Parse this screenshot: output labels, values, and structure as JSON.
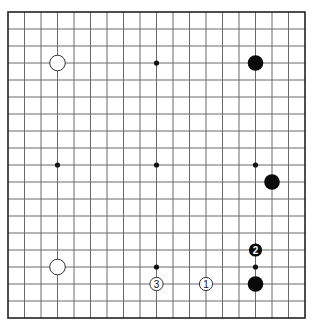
{
  "board": {
    "size": 19,
    "origin_x": 8,
    "origin_y": 12,
    "spacing_x": 16.5,
    "spacing_y": 17,
    "star_points": [
      [
        4,
        4
      ],
      [
        10,
        4
      ],
      [
        16,
        4
      ],
      [
        4,
        10
      ],
      [
        10,
        10
      ],
      [
        16,
        10
      ],
      [
        4,
        16
      ],
      [
        10,
        16
      ],
      [
        16,
        16
      ]
    ],
    "colors": {
      "line": "#6a6a6a",
      "border": "#222222",
      "black": "#0a0a0a",
      "white": "#ffffff"
    }
  },
  "stones": [
    {
      "color": "white",
      "col": 4,
      "row": 4,
      "label": ""
    },
    {
      "color": "black",
      "col": 16,
      "row": 4,
      "label": ""
    },
    {
      "color": "black",
      "col": 17,
      "row": 11,
      "label": ""
    },
    {
      "color": "white",
      "col": 4,
      "row": 16,
      "label": ""
    },
    {
      "color": "black",
      "col": 16,
      "row": 17,
      "label": ""
    },
    {
      "color": "white",
      "col": 13,
      "row": 17,
      "label": "1"
    },
    {
      "color": "black",
      "col": 16,
      "row": 15,
      "label": "2"
    },
    {
      "color": "white",
      "col": 10,
      "row": 17,
      "label": "3"
    }
  ]
}
